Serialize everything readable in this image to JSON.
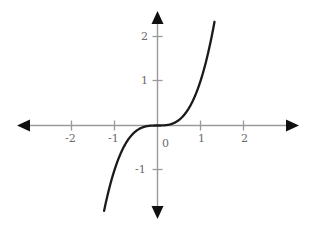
{
  "chart_data": {
    "type": "line",
    "title": "",
    "subtitle": "",
    "xlabel": "",
    "ylabel": "",
    "function": "y = x^3",
    "xlim": [
      -2.65,
      2.65
    ],
    "ylim": [
      -2.55,
      2.55
    ],
    "grid": false,
    "legend": null,
    "axis_arrows": [
      "left",
      "right",
      "up",
      "down"
    ],
    "xticks": [
      -2,
      -1,
      1,
      2
    ],
    "xtick_labels": [
      "-2",
      "-1",
      "1",
      "2"
    ],
    "yticks": [
      -1,
      1,
      2
    ],
    "ytick_labels": [
      "-1",
      "1",
      "2"
    ],
    "origin_label": "0",
    "series": [
      {
        "name": "y = x^3",
        "color": "#1a1a1a",
        "x_start": -2.05,
        "x_end": 1.58,
        "x": [
          -2.05,
          -1.9,
          -1.75,
          -1.6,
          -1.45,
          -1.3,
          -1.15,
          -1.0,
          -0.85,
          -0.7,
          -0.55,
          -0.4,
          -0.25,
          -0.1,
          0.0,
          0.1,
          0.25,
          0.4,
          0.55,
          0.7,
          0.85,
          1.0,
          1.15,
          1.3,
          1.45,
          1.58
        ],
        "y": [
          -8.615,
          -6.859,
          -5.359,
          -4.096,
          -3.048,
          -2.197,
          -1.521,
          -1.0,
          -0.614,
          -0.343,
          -0.166,
          -0.064,
          -0.016,
          -0.001,
          0.0,
          0.001,
          0.016,
          0.064,
          0.166,
          0.343,
          0.614,
          1.0,
          1.521,
          2.197,
          3.048,
          3.944
        ]
      }
    ],
    "colors": {
      "curve": "#1a1a1a",
      "axis": "#9a9a9a",
      "tick": "#9a9a9a",
      "label": "#6b6b6b",
      "arrow": "#101010",
      "background": "#ffffff"
    }
  }
}
